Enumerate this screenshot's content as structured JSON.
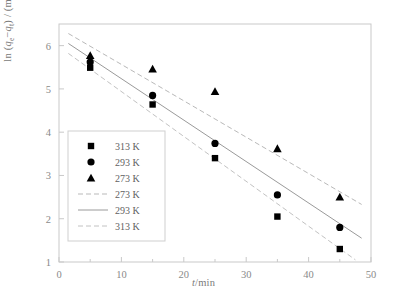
{
  "chart_data": {
    "type": "scatter",
    "title": "",
    "xlabel": "t/min",
    "ylabel": "ln (qe-qt) / (mg/g)",
    "ylabel_parts": {
      "prefix": "ln (",
      "q1": "q",
      "sub1": "e",
      "minus": "−",
      "q2": "q",
      "sub2": "t",
      "suffix": ") / (mg/g)"
    },
    "xlim": [
      0,
      50
    ],
    "ylim": [
      1,
      6.5
    ],
    "xticks": [
      0,
      10,
      20,
      30,
      40,
      50
    ],
    "xtick_labels": [
      "0",
      "10",
      "20",
      "30",
      "40",
      "50"
    ],
    "xminor": [
      5,
      15,
      25,
      35,
      45
    ],
    "yticks": [
      1,
      2,
      3,
      4,
      5,
      6
    ],
    "ytick_labels": [
      "1",
      "2",
      "3",
      "4",
      "5",
      "6"
    ],
    "grid": false,
    "legend_position": "lower-left-inside",
    "x": [
      5,
      15,
      25,
      35,
      45
    ],
    "series": [
      {
        "name": "313 K",
        "marker": "square",
        "color": "#000000",
        "values": [
          5.49,
          4.64,
          3.4,
          2.05,
          1.3
        ]
      },
      {
        "name": "293 K",
        "marker": "circle",
        "color": "#000000",
        "values": [
          5.62,
          4.85,
          3.74,
          2.55,
          1.8
        ]
      },
      {
        "name": "273 K",
        "marker": "triangle",
        "color": "#000000",
        "values": [
          5.77,
          5.46,
          4.94,
          3.62,
          2.5
        ]
      }
    ],
    "fit_lines": [
      {
        "name": "273 K",
        "style": "dashed",
        "color": "#b9b9b9",
        "x": [
          1.5,
          48.5
        ],
        "y": [
          6.28,
          2.33
        ]
      },
      {
        "name": "293 K",
        "style": "solid",
        "color": "#9a9a9a",
        "x": [
          1.5,
          48.5
        ],
        "y": [
          6.05,
          1.55
        ]
      },
      {
        "name": "313 K",
        "style": "dashed",
        "color": "#c2c2c2",
        "x": [
          1.5,
          47.5
        ],
        "y": [
          5.82,
          1.05
        ]
      }
    ],
    "legend": [
      {
        "label": "313 K",
        "type": "marker",
        "marker": "square",
        "color": "#000000"
      },
      {
        "label": "293 K",
        "type": "marker",
        "marker": "circle",
        "color": "#000000"
      },
      {
        "label": "273 K",
        "type": "marker",
        "marker": "triangle",
        "color": "#000000"
      },
      {
        "label": "273 K",
        "type": "line",
        "style": "dashed",
        "color": "#b9b9b9"
      },
      {
        "label": "293 K",
        "type": "line",
        "style": "solid",
        "color": "#9a9a9a"
      },
      {
        "label": "313 K",
        "type": "line",
        "style": "dashed",
        "color": "#c2c2c2"
      }
    ],
    "colors": {
      "axis": "#c9c9c9",
      "tick_label": "#8a8a8a",
      "marker": "#000000",
      "legend_border": "#cfcfcf",
      "background": "#ffffff"
    }
  }
}
